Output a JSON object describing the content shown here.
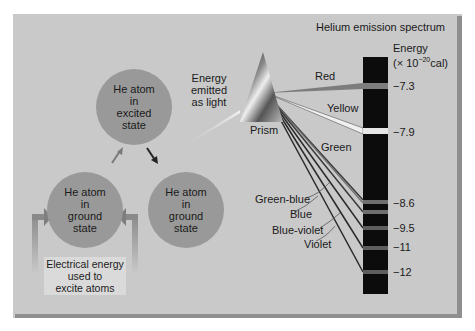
{
  "title": "Helium emission spectrum",
  "energy_axis": {
    "label_line1": "Energy",
    "label_line2_prefix": "(× 10",
    "label_line2_exp": "−20",
    "label_line2_suffix": "cal)"
  },
  "atoms": {
    "excited": [
      "He atom",
      "in",
      "excited",
      "state"
    ],
    "ground_left": [
      "He atom",
      "in",
      "ground",
      "state"
    ],
    "ground_right": [
      "He atom",
      "in",
      "ground",
      "state"
    ]
  },
  "energy_emitted_label": [
    "Energy",
    "emitted",
    "as light"
  ],
  "prism_label": "Prism",
  "electrical_energy_label": [
    "Electrical energy",
    "used to",
    "excite atoms"
  ],
  "spectrum_lines": [
    {
      "color": "Red",
      "energy": "−7.3",
      "y": 86,
      "band_color": "#7d7d7d"
    },
    {
      "color": "Yellow",
      "energy": "−7.9",
      "y": 131,
      "band_color": "#e6e6e6"
    },
    {
      "color": "Green",
      "energy": "−8.6",
      "y": 202,
      "band_color": "#6e6e6e"
    },
    {
      "color": "Green-blue",
      "energy": "",
      "y": 212,
      "band_color": "#6e6e6e"
    },
    {
      "color": "Blue",
      "energy": "−9.5",
      "y": 228,
      "band_color": "#5e5e5e"
    },
    {
      "color": "Blue-violet",
      "energy": "−11",
      "y": 248,
      "band_color": "#5e5e5e"
    },
    {
      "color": "Violet",
      "energy": "−12",
      "y": 272,
      "band_color": "#5e5e5e"
    }
  ],
  "color_labels": {
    "red": "Red",
    "yellow": "Yellow",
    "green": "Green",
    "green_blue": "Green-blue",
    "blue": "Blue",
    "blue_violet": "Blue-violet",
    "violet": "Violet"
  },
  "ticks": {
    "t1": "−7.3",
    "t2": "−7.9",
    "t3": "−8.6",
    "t4": "−9.5",
    "t5": "−11",
    "t6": "−12"
  }
}
